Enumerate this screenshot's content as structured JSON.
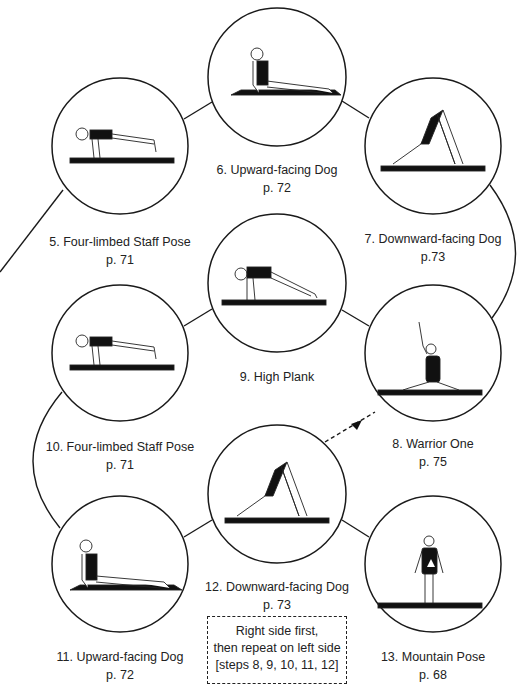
{
  "poses": [
    {
      "step": "5",
      "name": "5. Four-limbed Staff Pose",
      "page": "p. 71",
      "figure": "chaturanga"
    },
    {
      "step": "6",
      "name": "6. Upward-facing Dog",
      "page": "p. 72",
      "figure": "updog"
    },
    {
      "step": "7",
      "name": "7. Downward-facing Dog",
      "page": "p.73",
      "figure": "downdog"
    },
    {
      "step": "8",
      "name": "8. Warrior One",
      "page": "p. 75",
      "figure": "warrior"
    },
    {
      "step": "9",
      "name": "9. High Plank",
      "page": "",
      "figure": "plank"
    },
    {
      "step": "10",
      "name": "10. Four-limbed Staff Pose",
      "page": "p. 71",
      "figure": "chaturanga"
    },
    {
      "step": "11",
      "name": "11. Upward-facing Dog",
      "page": "p. 72",
      "figure": "updog"
    },
    {
      "step": "12",
      "name": "12. Downward-facing Dog",
      "page": "p. 73",
      "figure": "downdog"
    },
    {
      "step": "13",
      "name": "13. Mountain Pose",
      "page": "p. 68",
      "figure": "mountain"
    }
  ],
  "note": {
    "line1": "Right side first,",
    "line2": "then repeat on left side",
    "line3": "[steps 8, 9, 10, 11, 12]"
  },
  "colors": {
    "stroke": "#1a1a1a",
    "background": "#ffffff"
  }
}
